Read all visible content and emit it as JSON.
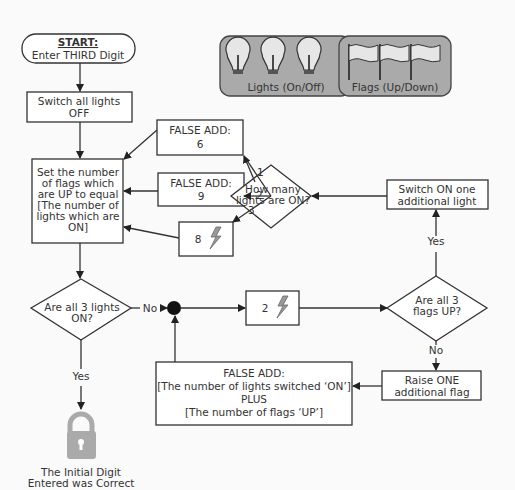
{
  "start": {
    "title": "START:",
    "text": "Enter THIRD Digit"
  },
  "legend": {
    "lights_label": "Lights (On/Off)",
    "flags_label": "Flags (Up/Down)"
  },
  "switch_off": [
    "Switch all lights",
    "OFF"
  ],
  "set_flags": [
    "Set the number",
    "of flags which",
    "are UP to equal",
    "[The number of",
    "lights which are",
    "ON]"
  ],
  "false_add_6": [
    "FALSE ADD:",
    "6"
  ],
  "false_add_9": [
    "FALSE ADD:",
    "9"
  ],
  "box_8": {
    "value": "8"
  },
  "how_many": [
    "How many",
    "lights are ON?"
  ],
  "branch_labels": [
    "1",
    "2",
    "3"
  ],
  "switch_on": [
    "Switch ON one",
    "additional light"
  ],
  "all_lights": [
    "Are all 3 lights",
    "ON?"
  ],
  "no_label": "No",
  "yes_label": "Yes",
  "box_2": {
    "value": "2"
  },
  "all_flags": [
    "Are all 3",
    "flags UP?"
  ],
  "flags_yes": "Yes",
  "flags_no": "No",
  "raise_flag": [
    "Raise ONE",
    "additional flag"
  ],
  "false_add_sum": [
    "FALSE ADD:",
    "[The number of lights switched ‘ON’]",
    "PLUS",
    "[The number of flags ‘UP’]"
  ],
  "end": [
    "The Initial Digit",
    "Entered was Correct"
  ]
}
